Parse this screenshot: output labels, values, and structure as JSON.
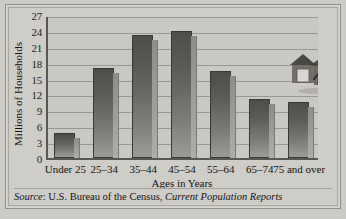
{
  "chart_data": {
    "type": "bar",
    "title": "",
    "xlabel": "Ages in Years",
    "ylabel": "Millions of Households",
    "categories": [
      "Under 25",
      "25–34",
      "35–44",
      "45–54",
      "55–64",
      "65–74",
      "75 and over"
    ],
    "values": [
      4.7,
      17.0,
      23.2,
      24.0,
      16.5,
      11.2,
      10.6
    ],
    "yticks": [
      0,
      3,
      6,
      9,
      12,
      15,
      18,
      21,
      24,
      27
    ],
    "ylim": [
      0,
      27
    ],
    "grid": true,
    "legend": "none",
    "series": [
      {
        "name": "Millions of Households",
        "values": [
          4.7,
          17.0,
          23.2,
          24.0,
          16.5,
          11.2,
          10.6
        ]
      }
    ],
    "annotations": [
      "house illustration with two figures, upper right"
    ]
  },
  "figure": {
    "axis": {
      "x_title": "Ages in Years",
      "y_title": "Millions of Households"
    },
    "source": {
      "label": "Source",
      "colon": ": ",
      "agency": "U.S. Bureau of the Census, ",
      "publication": "Current Population Reports"
    },
    "colors": {
      "background": "#cdcbc6",
      "plot_background": "#cac8c3",
      "bar_dark": "#4f4d49",
      "bar_light": "#9d9b96",
      "bar_shadow": "#9e9c97",
      "gridline": "#9a9893",
      "axis": "#5a5853",
      "frame": "#8e8c88",
      "text": "#141312"
    },
    "artwork": {
      "name": "house-illustration",
      "description": "Two-gable house with couple standing in front"
    }
  }
}
